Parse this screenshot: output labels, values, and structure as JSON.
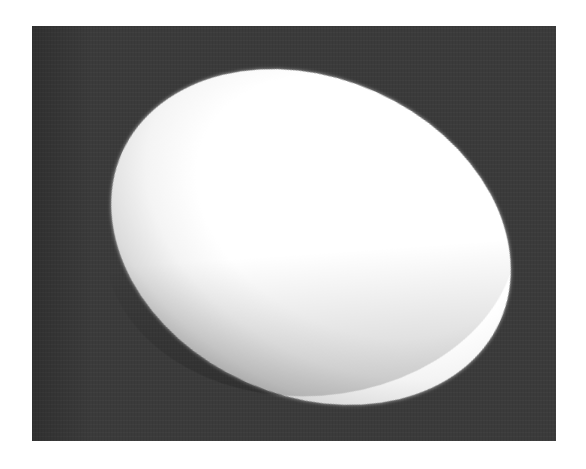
{
  "image": {
    "subject": "white ellipsoid (egg-like object) on dark background",
    "colors": {
      "page_background": "#ffffff",
      "frame_background": "#3b3b3b",
      "object_highlight": "#ffffff",
      "object_shadow": "#bdbdbd"
    }
  }
}
